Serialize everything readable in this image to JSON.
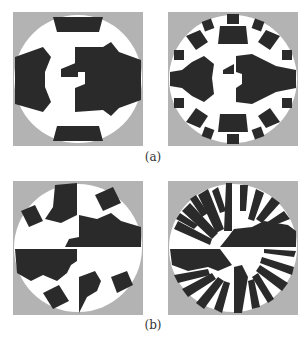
{
  "figure": {
    "colors": {
      "background": "#b3b3b3",
      "disc": "#ffffff",
      "ink": "#2a2a2a"
    },
    "rows": [
      {
        "caption": "(a)",
        "panels": [
          {
            "name": "panel-a-left",
            "description": "disc with 8 coarse sectors, C-shaped center"
          },
          {
            "name": "panel-a-right",
            "description": "disc with 16 finer sectors, C-shaped center"
          }
        ]
      },
      {
        "caption": "(b)",
        "panels": [
          {
            "name": "panel-b-left",
            "description": "quadrant-split disc, coarse pattern"
          },
          {
            "name": "panel-b-right",
            "description": "quadrant-split disc, fine radial comb pattern"
          }
        ]
      }
    ]
  }
}
